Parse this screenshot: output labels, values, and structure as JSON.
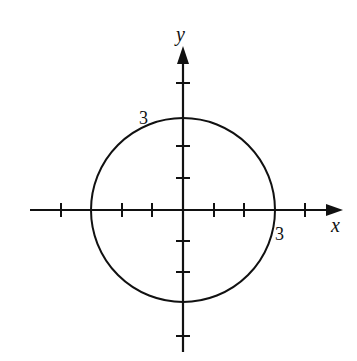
{
  "diagram": {
    "axes": {
      "x_label": "x",
      "y_label": "y",
      "tick_spacing_units": 1,
      "x_ticks": [
        -4,
        -3,
        -2,
        -1,
        1,
        2,
        3,
        4
      ],
      "y_ticks": [
        -4,
        -3,
        -2,
        -1,
        1,
        2,
        3,
        4
      ]
    },
    "circle": {
      "center": [
        0,
        0
      ],
      "radius": 3
    },
    "annotations": [
      {
        "text": "3",
        "position": "upper-left of circle near y=3"
      },
      {
        "text": "3",
        "position": "below x-axis near x=3"
      }
    ],
    "colors": {
      "stroke": "#111111",
      "background": "#ffffff"
    }
  }
}
